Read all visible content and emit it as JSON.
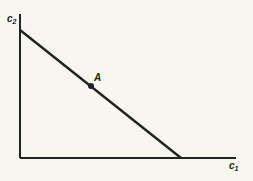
{
  "diagram": {
    "y_axis_label": "c",
    "y_axis_sub": "2",
    "x_axis_label": "c",
    "x_axis_sub": "1",
    "point_label": "A",
    "colors": {
      "background": "#f7f6ef",
      "ink": "#222222"
    }
  }
}
